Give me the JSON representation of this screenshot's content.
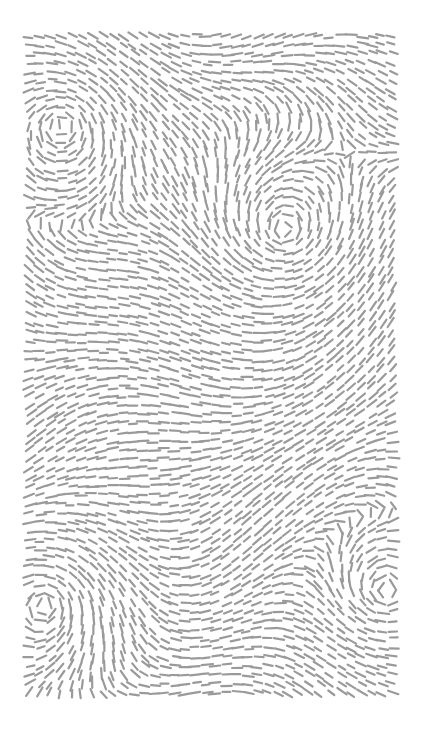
{
  "canvas": {
    "width": 425,
    "height": 752,
    "background": "#ffffff"
  },
  "artwork": {
    "title": "",
    "type": "flow-field dashes",
    "bounds": {
      "x0": 27,
      "y0": 33,
      "x1": 398,
      "y1": 703
    },
    "dash": {
      "color": "#9a9a9a",
      "length": 10,
      "thickness": 2.2,
      "spacing": 9
    },
    "vortices": [
      {
        "name": "top-left",
        "x": 62,
        "y": 123,
        "strength": 1.0,
        "radius": 70
      },
      {
        "name": "center-right",
        "x": 285,
        "y": 232,
        "strength": -1.0,
        "radius": 75
      },
      {
        "name": "bottom-left",
        "x": 47,
        "y": 603,
        "strength": 1.0,
        "radius": 65
      },
      {
        "name": "bottom-right",
        "x": 385,
        "y": 592,
        "strength": -1.0,
        "radius": 55
      }
    ]
  }
}
